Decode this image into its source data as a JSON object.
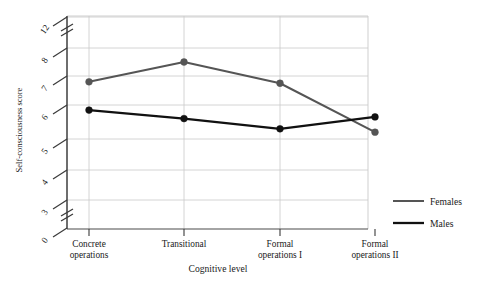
{
  "chart_data": {
    "type": "line",
    "title": "",
    "subtitle": "",
    "xlabel": "Cognitive level",
    "ylabel": "Self-consciousness score",
    "categories": [
      "Concrete operations",
      "Transitional",
      "Formal operations I",
      "Formal operations II"
    ],
    "category_lines": [
      [
        "Concrete",
        "operations"
      ],
      [
        "Transitional",
        ""
      ],
      [
        "Formal",
        "operations I"
      ],
      [
        "Formal",
        "operations II"
      ]
    ],
    "ytick_labels": [
      "12",
      "8",
      "7",
      "6",
      "5",
      "4",
      "3",
      "0"
    ],
    "ytick_values": [
      12,
      8,
      7,
      6,
      5,
      4,
      3,
      0
    ],
    "ylim": [
      0,
      12
    ],
    "y_axis_breaks": [
      "between 12 and 8",
      "between 3 and 0"
    ],
    "grid": "horizontal-and-vertical",
    "legend_position": "right",
    "series": [
      {
        "name": "Females",
        "color": "#555555",
        "values": [
          6.8,
          7.5,
          6.75,
          5.2
        ]
      },
      {
        "name": "Males",
        "color": "#111111",
        "values": [
          5.85,
          5.6,
          5.3,
          5.65
        ]
      }
    ]
  },
  "axis": {
    "y_title": "Self-consciousness score",
    "x_title": "Cognitive level"
  },
  "legend": {
    "items": [
      {
        "label": "Females",
        "color": "#555555"
      },
      {
        "label": "Males",
        "color": "#111111"
      }
    ]
  }
}
